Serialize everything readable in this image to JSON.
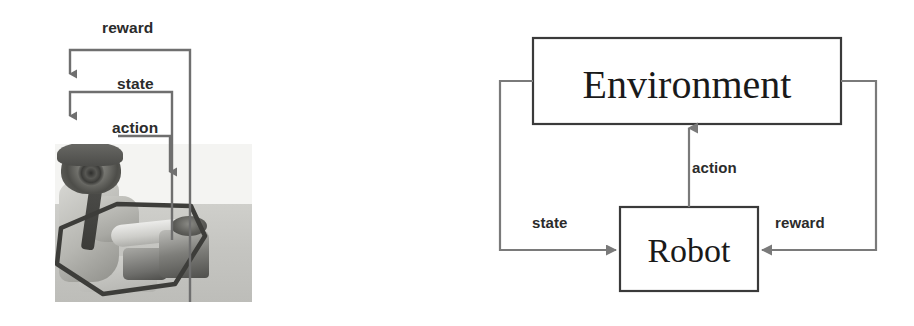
{
  "figure": {
    "stroke_color": "#4a4a4a",
    "box_border_color": "#3a3a3a",
    "text_color": "#2b2b2b",
    "background": "#ffffff"
  },
  "left_panel": {
    "name": "robot-photograph-with-annotations",
    "photo_description": "grayscale photograph of a humanoid robot seated at a table manipulating objects",
    "annotations": [
      {
        "id": "reward",
        "label": "reward"
      },
      {
        "id": "state",
        "label": "state"
      },
      {
        "id": "action",
        "label": "action"
      }
    ]
  },
  "right_panel": {
    "name": "block-diagram",
    "nodes": [
      {
        "id": "environment",
        "label": "Environment"
      },
      {
        "id": "robot",
        "label": "Robot"
      }
    ],
    "edges": [
      {
        "id": "action",
        "label": "action",
        "from": "robot",
        "to": "environment"
      },
      {
        "id": "state",
        "label": "state",
        "from": "environment",
        "to": "robot"
      },
      {
        "id": "reward",
        "label": "reward",
        "from": "environment",
        "to": "robot"
      }
    ]
  }
}
